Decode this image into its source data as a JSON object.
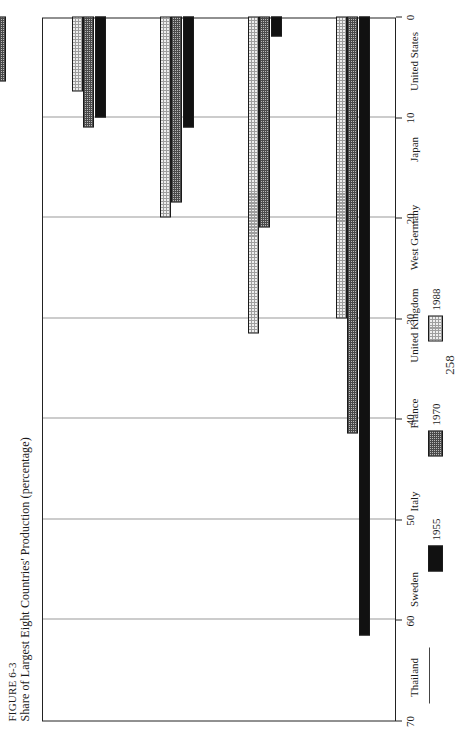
{
  "figure": {
    "number_label": "FIGURE 6-3",
    "caption": "Share of Largest Eight Countries' Production (percentage)"
  },
  "page": {
    "number": "258"
  },
  "legend": {
    "position": "bottom-right",
    "entries": [
      {
        "label": "1955",
        "pattern": "solid-black",
        "color": "#111111"
      },
      {
        "label": "1970",
        "pattern": "cross-hatch",
        "color": "#b9b9b9"
      },
      {
        "label": "1988",
        "pattern": "fine-dot",
        "color": "#eeeeee"
      }
    ]
  },
  "chart_data": {
    "type": "bar",
    "orientation": "horizontal-rotated",
    "title": "Share of Largest Eight Countries' Production (percentage)",
    "xlabel": "",
    "ylabel": "",
    "ylim": [
      0,
      70
    ],
    "tick_values": [
      0,
      10,
      20,
      30,
      40,
      50,
      60,
      70
    ],
    "tick_labels": [
      "0",
      "10",
      "20",
      "30",
      "40",
      "50",
      "60",
      "70"
    ],
    "grid": true,
    "legend_position": "bottom-right",
    "categories": [
      "United States",
      "Japan",
      "West Germany",
      "United Kingdom",
      "France",
      "Italy",
      "Sweden",
      "Thailand"
    ],
    "series": [
      {
        "name": "1955",
        "values": [
          61.5,
          2.0,
          11.0,
          10.0,
          0.0,
          0.0,
          4.5,
          0.0
        ]
      },
      {
        "name": "1970",
        "values": [
          41.5,
          21.0,
          18.5,
          11.0,
          6.5,
          5.5,
          3.5,
          0.0
        ]
      },
      {
        "name": "1988",
        "values": [
          30.0,
          31.5,
          20.0,
          7.5,
          10.0,
          6.0,
          3.5,
          1.5
        ]
      }
    ]
  }
}
